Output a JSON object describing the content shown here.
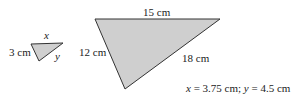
{
  "small_triangle": {
    "label_top": "x",
    "label_left": "3 cm",
    "label_right": "y",
    "fill": "#cfcfcf",
    "stroke": "#333333"
  },
  "large_triangle": {
    "label_top": "15 cm",
    "label_left": "12 cm",
    "label_right": "18 cm",
    "fill": "#cfcfcf",
    "stroke": "#333333"
  },
  "answer": {
    "x_var": "x",
    "x_rest": " = 3.75 cm; ",
    "y_var": "y",
    "y_rest": " = 4.5 cm"
  }
}
